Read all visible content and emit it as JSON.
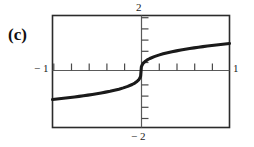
{
  "figure": {
    "panel_label": "(c)",
    "caption": ""
  },
  "chart_data": {
    "type": "line",
    "title": "",
    "xlabel": "",
    "ylabel": "",
    "xlim": [
      -1,
      1
    ],
    "ylim": [
      -2,
      2
    ],
    "grid": false,
    "legend": null,
    "axis_labels": {
      "top": "2",
      "bottom": "− 2",
      "left": "− 1",
      "right": "1"
    },
    "x_ticks": [
      -0.8,
      -0.6,
      -0.4,
      -0.2,
      0.2,
      0.4,
      0.6,
      0.8
    ],
    "y_ticks": [
      -1.6,
      -1.2,
      -0.8,
      -0.4,
      0.4,
      0.8,
      1.2,
      1.6
    ],
    "series": [
      {
        "name": "y = x^(1/3)",
        "x": [
          -1.0,
          -0.95,
          -0.9,
          -0.85,
          -0.8,
          -0.75,
          -0.7,
          -0.65,
          -0.6,
          -0.55,
          -0.5,
          -0.45,
          -0.4,
          -0.35,
          -0.3,
          -0.25,
          -0.2,
          -0.15,
          -0.1,
          -0.07,
          -0.05,
          -0.03,
          -0.02,
          -0.01,
          -0.004,
          0.0,
          0.004,
          0.01,
          0.02,
          0.03,
          0.05,
          0.07,
          0.1,
          0.15,
          0.2,
          0.25,
          0.3,
          0.35,
          0.4,
          0.45,
          0.5,
          0.55,
          0.6,
          0.65,
          0.7,
          0.75,
          0.8,
          0.85,
          0.9,
          0.95,
          1.0
        ],
        "y": [
          -1.0,
          -0.983,
          -0.965,
          -0.947,
          -0.928,
          -0.909,
          -0.888,
          -0.866,
          -0.843,
          -0.819,
          -0.794,
          -0.766,
          -0.737,
          -0.705,
          -0.669,
          -0.63,
          -0.585,
          -0.531,
          -0.464,
          -0.412,
          -0.368,
          -0.311,
          -0.271,
          -0.215,
          -0.159,
          0.0,
          0.159,
          0.215,
          0.271,
          0.311,
          0.368,
          0.412,
          0.464,
          0.531,
          0.585,
          0.63,
          0.669,
          0.705,
          0.737,
          0.766,
          0.794,
          0.819,
          0.843,
          0.866,
          0.888,
          0.909,
          0.928,
          0.947,
          0.965,
          0.983,
          1.0
        ]
      }
    ]
  },
  "style": {
    "curve_color": "#1a1a1a",
    "frame_color": "#2b2b2b",
    "axis_color": "#555555",
    "background": "#ffffff"
  }
}
